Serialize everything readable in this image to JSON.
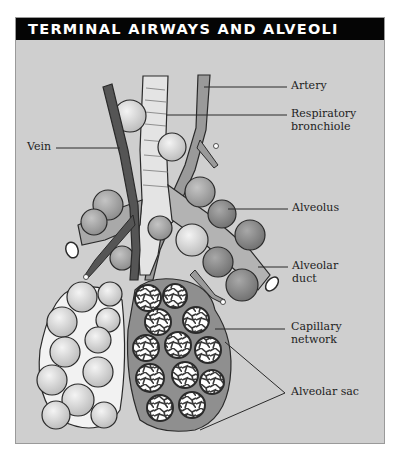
{
  "figure": {
    "title": "TERMINAL AIRWAYS AND ALVEOLI",
    "colors": {
      "background": "#cfcfcf",
      "header_bg": "#050505",
      "header_text": "#ffffff",
      "vein": "#555555",
      "artery": "#9a9a9a",
      "bronchiole": "#e4e4e4",
      "alveolus_light": "#dcdcdc",
      "alveolus_dark": "#8f8f8f",
      "outline": "#2a2a2a"
    },
    "labels": {
      "artery": "Artery",
      "respiratory_bronchiole_1": "Respiratory",
      "respiratory_bronchiole_2": "bronchiole",
      "vein": "Vein",
      "alveolus": "Alveolus",
      "alveolar_duct_1": "Alveolar",
      "alveolar_duct_2": "duct",
      "capillary_network_1": "Capillary",
      "capillary_network_2": "network",
      "alveolar_sac": "Alveolar sac"
    }
  }
}
